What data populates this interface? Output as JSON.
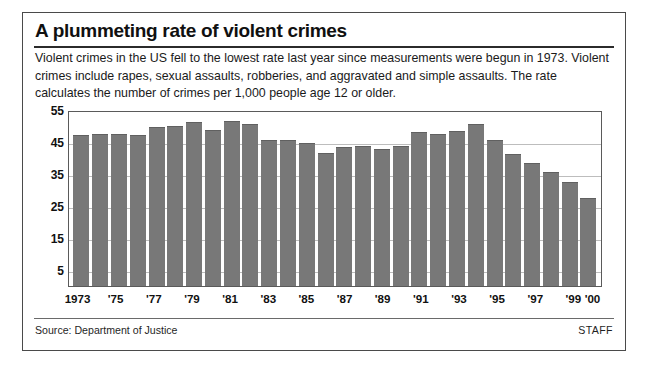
{
  "header": {
    "title": "A plummeting rate of violent crimes",
    "subtitle": "Violent crimes in the US fell to the lowest rate last year since measurements were begun in 1973. Violent crimes include rapes, sexual assaults, robberies, and aggravated and simple assaults. The rate calculates the number of crimes per 1,000 people age 12 or older."
  },
  "footer": {
    "source": "Source: Department of Justice",
    "credit": "STAFF"
  },
  "colors": {
    "bar": "#787878",
    "border": "#4a4a4a",
    "gridline": "#bdbdbd",
    "text": "#101010"
  },
  "chart_data": {
    "type": "bar",
    "title": "A plummeting rate of violent crimes",
    "xlabel": "",
    "ylabel": "",
    "ylim": [
      0,
      55
    ],
    "yticks": [
      5,
      15,
      25,
      35,
      45,
      55
    ],
    "grid": true,
    "legend": false,
    "units": "violent crimes per 1,000 people age 12 or older",
    "categories": [
      "1973",
      "1974",
      "1975",
      "1976",
      "1977",
      "1978",
      "1979",
      "1980",
      "1981",
      "1982",
      "1983",
      "1984",
      "1985",
      "1986",
      "1987",
      "1988",
      "1989",
      "1990",
      "1991",
      "1992",
      "1993",
      "1994",
      "1995",
      "1996",
      "1997",
      "1998",
      "1999",
      "2000"
    ],
    "tick_labels": [
      {
        "category": "1973",
        "label": "1973"
      },
      {
        "category": "1975",
        "label": "'75"
      },
      {
        "category": "1977",
        "label": "'77"
      },
      {
        "category": "1979",
        "label": "'79"
      },
      {
        "category": "1981",
        "label": "'81"
      },
      {
        "category": "1983",
        "label": "'83"
      },
      {
        "category": "1985",
        "label": "'85"
      },
      {
        "category": "1987",
        "label": "'87"
      },
      {
        "category": "1989",
        "label": "'89"
      },
      {
        "category": "1991",
        "label": "'91"
      },
      {
        "category": "1993",
        "label": "'93"
      },
      {
        "category": "1995",
        "label": "'95"
      },
      {
        "category": "1997",
        "label": "'97"
      },
      {
        "category": "1999",
        "label": "'99"
      },
      {
        "category": "2000",
        "label": "'00"
      }
    ],
    "values": [
      47.7,
      48.0,
      48.0,
      47.8,
      50.4,
      50.6,
      51.7,
      49.4,
      52.3,
      51.1,
      46.0,
      46.3,
      45.2,
      42.0,
      44.0,
      44.1,
      43.3,
      44.1,
      48.8,
      47.9,
      49.1,
      51.2,
      46.1,
      41.6,
      38.8,
      36.0,
      32.8,
      27.9
    ]
  }
}
